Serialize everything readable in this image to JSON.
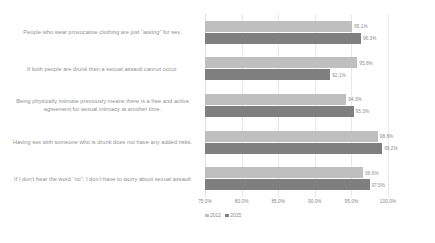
{
  "chart_data": {
    "type": "bar",
    "orientation": "horizontal",
    "title": "",
    "xlabel": "",
    "ylabel": "",
    "xlim": [
      75.0,
      100.0
    ],
    "grid": true,
    "legend_position": "bottom-left",
    "xticks": [
      "75.0%",
      "80.0%",
      "85.0%",
      "90.0%",
      "95.0%",
      "100.0%"
    ],
    "xtick_values": [
      75.0,
      80.0,
      85.0,
      90.0,
      95.0,
      100.0
    ],
    "categories": [
      "People who wear provocative clothing are just “asking” for sex.",
      "If both people are drunk then a sexual assault cannot occur.",
      "Being physically intimate previously means there is a free and active agreement for sexual intimacy at another time.",
      "Having sex with someone who is drunk does not have any added risks.",
      "If I don’t hear the word “no”, I don’t have to worry about sexual assault"
    ],
    "series": [
      {
        "name": "2012",
        "color": "#bfbfbf",
        "values": [
          95.1,
          95.8,
          94.3,
          98.6,
          96.6
        ],
        "labels": [
          "95.1%",
          "95.8%",
          "94.3%",
          "98.6%",
          "96.6%"
        ]
      },
      {
        "name": "2015",
        "color": "#7f7f7f",
        "values": [
          96.3,
          92.1,
          95.3,
          99.2,
          97.5
        ],
        "labels": [
          "96.3%",
          "92.1%",
          "95.3%",
          "99.2%",
          "97.5%"
        ]
      }
    ]
  }
}
